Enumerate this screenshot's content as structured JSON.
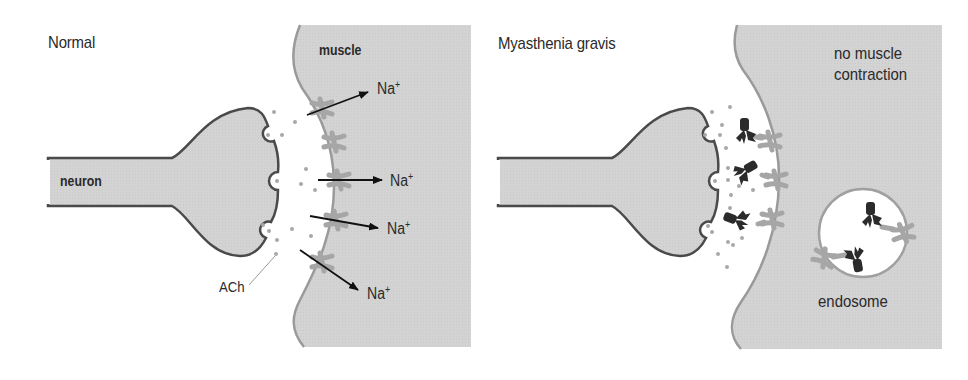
{
  "panels": [
    {
      "id": "normal",
      "title": "Normal",
      "labels": {
        "neuron": "neuron",
        "muscle": "muscle",
        "neurotransmitter": "ACh"
      },
      "ions": [
        {
          "text": "Na",
          "charge": "+"
        },
        {
          "text": "Na",
          "charge": "+"
        },
        {
          "text": "Na",
          "charge": "+"
        },
        {
          "text": "Na",
          "charge": "+"
        }
      ]
    },
    {
      "id": "myasthenia-gravis",
      "title": "Myasthenia gravis",
      "labels": {
        "outcome_line1": "no muscle",
        "outcome_line2": "contraction",
        "endosome": "endosome"
      }
    }
  ],
  "colors": {
    "cell_fill": "#d2d2d2",
    "neuron_outline": "#4a4a4a",
    "muscle_outline": "#9a9a9a",
    "receptor": "#a6a6a6",
    "antibody": "#2b2b2b",
    "ach_dot": "#a8a8a8",
    "arrow": "#111111",
    "background": "#ffffff"
  }
}
